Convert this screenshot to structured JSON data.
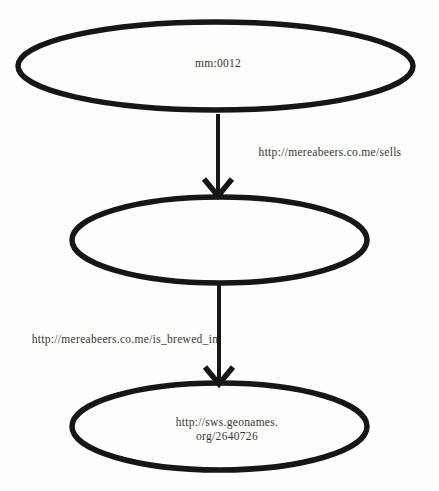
{
  "colors": {
    "background": "#fdfdfb",
    "stroke": "#161616",
    "text": "#363636"
  },
  "diagram": {
    "type": "rdf-graph",
    "nodes": [
      {
        "id": "top",
        "label": "mm:0012"
      },
      {
        "id": "middle",
        "label": ""
      },
      {
        "id": "bottom",
        "label_line1": "http://sws.geonames.",
        "label_line2": "org/2640726"
      }
    ],
    "edges": [
      {
        "from": "top",
        "to": "middle",
        "label": "http://mereabeers.co.me/sells"
      },
      {
        "from": "middle",
        "to": "bottom",
        "label": "http://mereabeers.co.me/is_brewed_in"
      }
    ]
  }
}
